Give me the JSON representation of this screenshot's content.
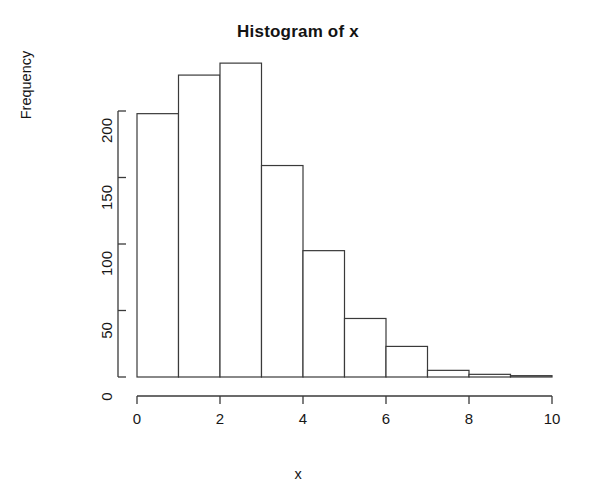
{
  "chart_data": {
    "type": "bar",
    "title": "Histogram of x",
    "subtitle": "",
    "xlabel": "x",
    "ylabel": "Frequency",
    "categories": [
      "0-1",
      "1-2",
      "2-3",
      "3-4",
      "4-5",
      "5-6",
      "6-7",
      "7-8",
      "8-9",
      "9-10"
    ],
    "bin_edges": [
      0,
      1,
      2,
      3,
      4,
      5,
      6,
      7,
      8,
      9,
      10
    ],
    "values": [
      198,
      227,
      236,
      159,
      95,
      44,
      23,
      5,
      2,
      1
    ],
    "xlim": [
      0,
      10
    ],
    "ylim": [
      0,
      250
    ],
    "xticks": [
      0,
      2,
      4,
      6,
      8,
      10
    ],
    "xtick_labels": [
      "0",
      "2",
      "4",
      "6",
      "8",
      "10"
    ],
    "yticks": [
      0,
      50,
      100,
      150,
      200
    ],
    "ytick_labels": [
      "0",
      "50",
      "100",
      "150",
      "200"
    ],
    "grid": false,
    "legend": false,
    "legend_position": "none",
    "bar_fill_color": "#ffffff",
    "bar_edge_color": "#3a3a3a",
    "axis_color": "#3a3a3a",
    "background_color": "#ffffff",
    "text_color": "#171717"
  }
}
